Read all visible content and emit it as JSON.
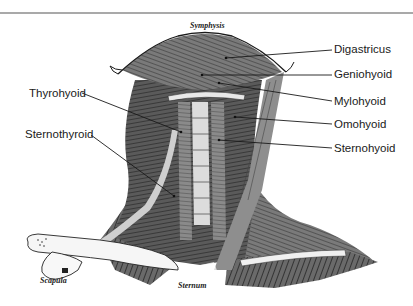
{
  "figure": {
    "bone_labels": {
      "symphysis": "Symphysis",
      "scapula": "Scapula",
      "sternum": "Sternum"
    },
    "muscle_labels": {
      "digastricus": "Digastricus",
      "geniohyoid": "Geniohyoid",
      "mylohyoid": "Mylohyoid",
      "omohyoid": "Omohyoid",
      "sternohyoid": "Sternohyoid",
      "thyrohyoid": "Thyrohyoid",
      "sternothyroid": "Sternothyroid"
    },
    "colors": {
      "line": "#1a1a1a",
      "rule": "#a9a9a9",
      "muscle_dark": "#3a3a3a",
      "muscle_mid": "#6e6e6e",
      "muscle_light": "#9a9a9a",
      "bone": "#f4f4f4"
    }
  }
}
